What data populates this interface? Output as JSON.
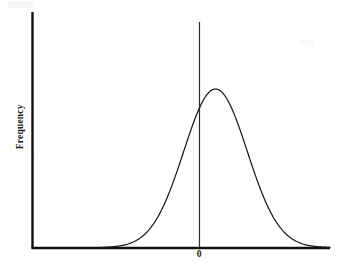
{
  "figure": {
    "background_color": "#ffffff",
    "line_color": "#1a1a1a",
    "axis_color": "#111111"
  },
  "labels": {
    "y_axis": "Frequency",
    "x_tick_zero": "0"
  },
  "chart_data": {
    "type": "line",
    "title": "",
    "subtitle": "",
    "xlabel": "",
    "ylabel": "Frequency",
    "grid": false,
    "legend": null,
    "annotations": [
      {
        "text": "0",
        "x": 0,
        "y": 0,
        "position": "below-x-axis",
        "description": "center tick label marking the mean of the distribution"
      }
    ],
    "axis": {
      "x_tick_labels": [
        "0"
      ],
      "y_tick_labels": [],
      "x_ticks_shown": false,
      "y_ticks_shown": false,
      "xlim": [
        -3.6,
        3.6
      ],
      "ylim": [
        0,
        1.22
      ],
      "vertical_reference_line_at_x": 0
    },
    "series": [
      {
        "name": "Normal distribution curve",
        "shape": "gaussian",
        "mean": 0,
        "sigma": 1,
        "peak_value": 1.0,
        "x": [
          -3.6,
          -3.2,
          -2.8,
          -2.4,
          -2.0,
          -1.6,
          -1.2,
          -0.8,
          -0.4,
          0.0,
          0.4,
          0.8,
          1.2,
          1.6,
          2.0,
          2.4,
          2.8,
          3.2,
          3.6
        ],
        "values": [
          0.0015,
          0.006,
          0.0198,
          0.0561,
          0.1353,
          0.278,
          0.4868,
          0.7261,
          0.9231,
          1.0,
          0.9231,
          0.7261,
          0.4868,
          0.278,
          0.1353,
          0.0561,
          0.0198,
          0.006,
          0.0015
        ]
      }
    ]
  }
}
